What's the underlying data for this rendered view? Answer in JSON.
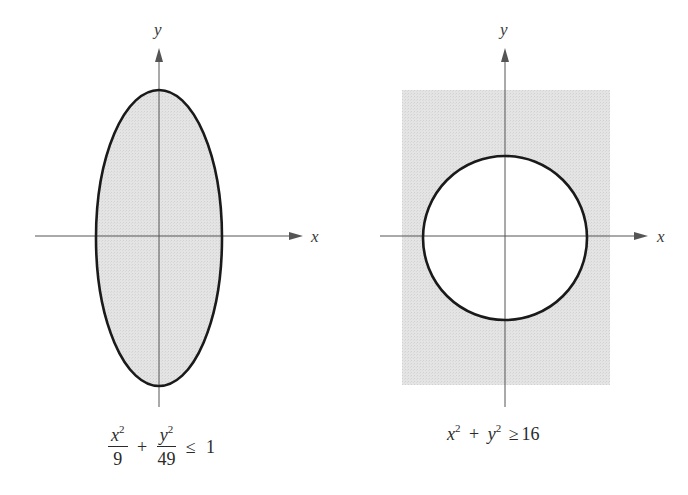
{
  "figure": {
    "colors": {
      "shade": "#e2e2e2",
      "curve": "#1a1a1a",
      "axis": "#555555",
      "background": "#ffffff"
    },
    "left_graph": {
      "x_axis_label": "x",
      "y_axis_label": "y",
      "shape": "ellipse",
      "shaded_region": "inside",
      "formula": {
        "term1_numerator_var": "x",
        "term1_numerator_exp": "2",
        "term1_denominator": "9",
        "plus": "+",
        "term2_numerator_var": "y",
        "term2_numerator_exp": "2",
        "term2_denominator": "49",
        "relation": "≤",
        "rhs": "1"
      },
      "formula_text": "x^2/9 + y^2/49 ≤ 1"
    },
    "right_graph": {
      "x_axis_label": "x",
      "y_axis_label": "y",
      "shape": "circle",
      "shaded_region": "outside",
      "formula": {
        "var1": "x",
        "exp1": "2",
        "plus": "+",
        "var2": "y",
        "exp2": "2",
        "relation": "≥",
        "rhs": "16"
      },
      "formula_text": "x^2 + y^2 ≥ 16"
    }
  }
}
